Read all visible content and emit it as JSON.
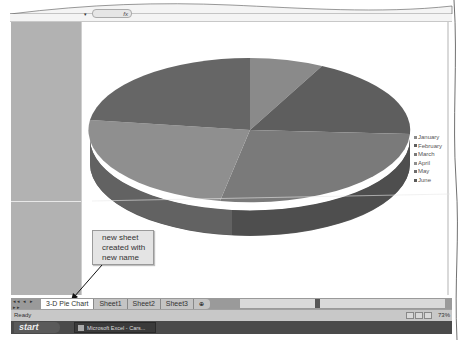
{
  "formula_bar": {
    "fx_label": "fx",
    "name_box_arrow": "▾"
  },
  "chart": {
    "legend": [
      {
        "label": "January",
        "color": "#8a8a8a"
      },
      {
        "label": "February",
        "color": "#5e5e5e"
      },
      {
        "label": "March",
        "color": "#7a7a7a"
      },
      {
        "label": "April",
        "color": "#8f8f8f"
      },
      {
        "label": "May",
        "color": "#6e6e6e"
      },
      {
        "label": "June",
        "color": "#5a5a5a"
      }
    ]
  },
  "callout": {
    "text_line1": "new sheet",
    "text_line2": "created with",
    "text_line3": "new name"
  },
  "sheet_tabs": {
    "nav_arrows": "◂◂ ◂ ▸ ▸▸",
    "tabs": [
      {
        "label": "3-D Pie Chart",
        "active": true
      },
      {
        "label": "Sheet1",
        "active": false
      },
      {
        "label": "Sheet2",
        "active": false
      },
      {
        "label": "Sheet3",
        "active": false
      }
    ],
    "insert_tab_icon": "⊕"
  },
  "status_bar": {
    "status": "Ready",
    "zoom": "73%"
  },
  "taskbar": {
    "start_label": "start",
    "task_item": "Microsoft Excel - Cars..."
  }
}
